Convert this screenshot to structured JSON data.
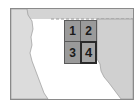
{
  "map": {
    "colors": {
      "land": "#d4d4d4",
      "water": "#ffffff",
      "tile_fill": "#9a9a9a",
      "tile_border": "#5a5a5a",
      "frame_border": "#8a8a8a"
    },
    "tiles": [
      {
        "id": "1",
        "label": "1",
        "selected": false
      },
      {
        "id": "2",
        "label": "2",
        "selected": false
      },
      {
        "id": "3",
        "label": "3",
        "selected": false
      },
      {
        "id": "4",
        "label": "4",
        "selected": true
      }
    ]
  }
}
